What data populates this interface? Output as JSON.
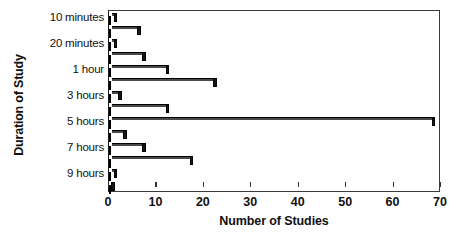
{
  "chart_data": {
    "type": "bar",
    "orientation": "horizontal",
    "title": "",
    "xlabel": "Number of Studies",
    "ylabel": "Duration of Study",
    "xlim": [
      0,
      70
    ],
    "xticks": [
      0,
      10,
      20,
      30,
      40,
      50,
      60,
      70
    ],
    "grid": false,
    "legend": null,
    "categories": [
      "10 minutes",
      "15 minutes",
      "20 minutes",
      "30 minutes",
      "1 hour",
      "2 hours",
      "3 hours",
      "4 hours",
      "5 hours",
      "6 hours",
      "7 hours",
      "8 hours",
      "9 hours",
      "10 hours"
    ],
    "visible_ytick_labels": [
      "10 minutes",
      "20 minutes",
      "1 hour",
      "3 hours",
      "5 hours",
      "7 hours",
      "9 hours"
    ],
    "values": [
      1,
      6,
      1,
      7,
      12,
      22,
      2,
      12,
      68,
      3,
      7,
      17,
      1,
      0
    ],
    "bar_style": {
      "fill": "#b9b9b9",
      "pattern": "fine-crosshatch",
      "edge": "#000000",
      "shadow": "#161616"
    }
  },
  "axes": {
    "ylabel": "Duration of Study",
    "xlabel": "Number of Studies",
    "xticks": [
      "0",
      "10",
      "20",
      "30",
      "40",
      "50",
      "60",
      "70"
    ],
    "yticks": [
      "10 minutes",
      "20 minutes",
      "1 hour",
      "3 hours",
      "5 hours",
      "7 hours",
      "9 hours"
    ]
  },
  "caption": ""
}
